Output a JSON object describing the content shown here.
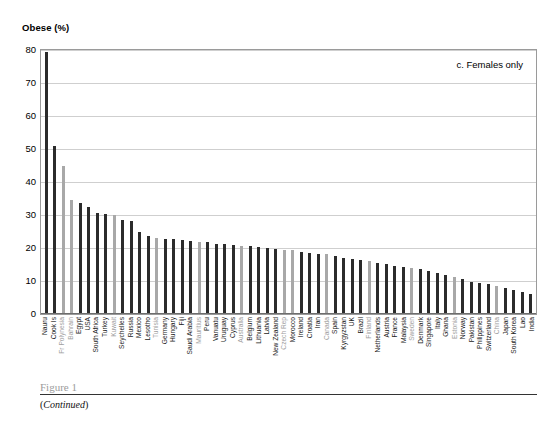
{
  "chart_data": {
    "type": "bar",
    "title": "Obese (%)",
    "annotation": "c. Females only",
    "xlabel": "",
    "ylabel": "Obese (%)",
    "ylim": [
      0,
      80
    ],
    "yticks": [
      80,
      70,
      60,
      50,
      40,
      30,
      20,
      10,
      0
    ],
    "grid": true,
    "legend_position": "none",
    "colors": {
      "dark": "#2b2b2b",
      "light": "#a8a8a8",
      "grid": "#cfcfcf",
      "axis": "#9a9a9a"
    },
    "categories": [
      "Nauru",
      "Cook Is",
      "Fr Polynesia",
      "Bahrain",
      "Egypt",
      "USA",
      "South Africa",
      "Turkey",
      "Kuwait",
      "Seychelles",
      "Russia",
      "Mexico",
      "Lesotho",
      "Tunisia",
      "Germany",
      "Hungary",
      "Fiji",
      "Saudi Arabia",
      "Mauritius",
      "Peru",
      "Vanuatu",
      "Uruguay",
      "Cyprus",
      "Australia",
      "Belgium",
      "Lithuania",
      "Latvia",
      "New Zealand",
      "Czech Rep",
      "Morocco",
      "Ireland",
      "Croatia",
      "Iran",
      "Canada",
      "Spain",
      "Kyrgyzstan",
      "UK",
      "Brazil",
      "Finland",
      "Netherlands",
      "Austria",
      "France",
      "Malaysia",
      "Sweden",
      "Denmark",
      "Singapore",
      "Italy",
      "Ghana",
      "Estonia",
      "Norway",
      "Pakistan",
      "Philippines",
      "Switzerland",
      "China",
      "Japan",
      "South Korea",
      "Lao",
      "India"
    ],
    "values": [
      79,
      50.5,
      44.5,
      34.3,
      33.2,
      32,
      30.2,
      30,
      29.8,
      28.2,
      28,
      24.5,
      23.2,
      22.7,
      22.5,
      22.3,
      22,
      21.8,
      21.6,
      21.4,
      21,
      20.9,
      20.6,
      20.4,
      20.2,
      20,
      19.6,
      19.4,
      19.2,
      19,
      18.6,
      18.3,
      18,
      17.8,
      17.3,
      16.8,
      16.5,
      16.2,
      15.8,
      15.3,
      14.9,
      14.2,
      13.8,
      13.5,
      13.2,
      12.8,
      12.2,
      11.5,
      11,
      10.2,
      9.5,
      9.2,
      8.8,
      8.2,
      7.6,
      7,
      6.4,
      5.8
    ],
    "series_shading": [
      "dark",
      "dark",
      "light",
      "light",
      "dark",
      "dark",
      "dark",
      "dark",
      "light",
      "dark",
      "dark",
      "dark",
      "dark",
      "light",
      "dark",
      "dark",
      "dark",
      "dark",
      "light",
      "dark",
      "dark",
      "dark",
      "dark",
      "light",
      "dark",
      "dark",
      "dark",
      "dark",
      "light",
      "light",
      "dark",
      "dark",
      "dark",
      "light",
      "dark",
      "dark",
      "dark",
      "dark",
      "light",
      "dark",
      "dark",
      "dark",
      "dark",
      "light",
      "dark",
      "dark",
      "dark",
      "dark",
      "light",
      "dark",
      "dark",
      "dark",
      "dark",
      "light",
      "dark",
      "dark",
      "dark",
      "dark"
    ],
    "label_shading": [
      "dark",
      "dark",
      "muted",
      "muted",
      "dark",
      "dark",
      "dark",
      "dark",
      "muted",
      "dark",
      "dark",
      "dark",
      "dark",
      "muted",
      "dark",
      "dark",
      "dark",
      "dark",
      "muted",
      "dark",
      "dark",
      "dark",
      "dark",
      "muted",
      "dark",
      "dark",
      "dark",
      "dark",
      "muted",
      "dark",
      "dark",
      "dark",
      "dark",
      "muted",
      "dark",
      "dark",
      "dark",
      "dark",
      "muted",
      "dark",
      "dark",
      "dark",
      "dark",
      "muted",
      "dark",
      "dark",
      "dark",
      "dark",
      "muted",
      "dark",
      "dark",
      "dark",
      "dark",
      "muted",
      "dark",
      "dark",
      "dark",
      "dark"
    ]
  },
  "figure": {
    "title": "Figure 1",
    "continued_open": "(",
    "continued_text": "Continued",
    "continued_close": ")"
  }
}
